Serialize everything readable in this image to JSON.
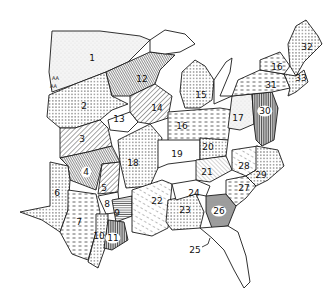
{
  "map": {
    "title": "",
    "subject": "Eastern United States divided into numbered regions with hatched/dotted fill patterns",
    "regions": [
      {
        "id": "1",
        "label": "1",
        "x": 92,
        "y": 58,
        "pattern": "stipple"
      },
      {
        "id": "2",
        "label": "2",
        "x": 84,
        "y": 106,
        "pattern": "dots"
      },
      {
        "id": "3",
        "label": "3",
        "x": 82,
        "y": 139,
        "pattern": "diag-right"
      },
      {
        "id": "4",
        "label": "4",
        "x": 86,
        "y": 172,
        "pattern": "diag-dense"
      },
      {
        "id": "5",
        "label": "5",
        "x": 104,
        "y": 188,
        "pattern": "diag-right"
      },
      {
        "id": "6",
        "label": "6",
        "x": 57,
        "y": 193,
        "pattern": "dots"
      },
      {
        "id": "7",
        "label": "7",
        "x": 79,
        "y": 222,
        "pattern": "dashes"
      },
      {
        "id": "8",
        "label": "8",
        "x": 107,
        "y": 204,
        "pattern": "blank"
      },
      {
        "id": "9",
        "label": "9",
        "x": 117,
        "y": 213,
        "pattern": "horiz"
      },
      {
        "id": "10",
        "label": "10",
        "x": 99,
        "y": 236,
        "pattern": "dots"
      },
      {
        "id": "11",
        "label": "11",
        "x": 113,
        "y": 238,
        "pattern": "vertical"
      },
      {
        "id": "12",
        "label": "12",
        "x": 142,
        "y": 79,
        "pattern": "diag-dense"
      },
      {
        "id": "13",
        "label": "13",
        "x": 119,
        "y": 119,
        "pattern": "blank"
      },
      {
        "id": "14",
        "label": "14",
        "x": 157,
        "y": 108,
        "pattern": "diag-right"
      },
      {
        "id": "15",
        "label": "15",
        "x": 201,
        "y": 95,
        "pattern": "dots"
      },
      {
        "id": "16",
        "label": "16",
        "x": 182,
        "y": 126,
        "pattern": "dashes"
      },
      {
        "id": "17",
        "label": "17",
        "x": 238,
        "y": 118,
        "pattern": "stipple"
      },
      {
        "id": "18",
        "label": "18",
        "x": 133,
        "y": 163,
        "pattern": "dots"
      },
      {
        "id": "19",
        "label": "19",
        "x": 177,
        "y": 154,
        "pattern": "blank"
      },
      {
        "id": "20",
        "label": "20",
        "x": 208,
        "y": 147,
        "pattern": "dots"
      },
      {
        "id": "21",
        "label": "21",
        "x": 207,
        "y": 172,
        "pattern": "diag-light"
      },
      {
        "id": "22",
        "label": "22",
        "x": 157,
        "y": 201,
        "pattern": "diag-dash"
      },
      {
        "id": "23",
        "label": "23",
        "x": 185,
        "y": 210,
        "pattern": "dots"
      },
      {
        "id": "24",
        "label": "24",
        "x": 194,
        "y": 193,
        "pattern": "blank"
      },
      {
        "id": "25",
        "label": "25",
        "x": 195,
        "y": 247,
        "pattern": "leader"
      },
      {
        "id": "26",
        "label": "26",
        "x": 219,
        "y": 211,
        "pattern": "horiz-dense"
      },
      {
        "id": "27",
        "label": "27",
        "x": 244,
        "y": 188,
        "pattern": "dashes"
      },
      {
        "id": "28",
        "label": "28",
        "x": 244,
        "y": 166,
        "pattern": "diag-dash"
      },
      {
        "id": "29",
        "label": "29",
        "x": 261,
        "y": 175,
        "pattern": "dots"
      },
      {
        "id": "30",
        "label": "30",
        "x": 265,
        "y": 111,
        "pattern": "vertical"
      },
      {
        "id": "31",
        "label": "31",
        "x": 271,
        "y": 85,
        "pattern": "dashes"
      },
      {
        "id": "32",
        "label": "32",
        "x": 307,
        "y": 47,
        "pattern": "dots"
      },
      {
        "id": "33",
        "label": "33",
        "x": 301,
        "y": 78,
        "pattern": "dots"
      },
      {
        "id": "16b",
        "label": "16",
        "x": 277,
        "y": 67,
        "pattern": "dashes"
      }
    ],
    "annotations": {
      "aa_marks": "AA"
    }
  }
}
